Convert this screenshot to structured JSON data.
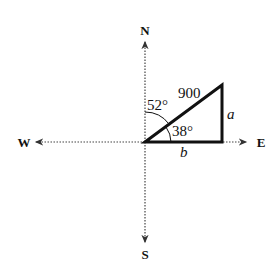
{
  "diagram": {
    "type": "vector-compass-triangle",
    "compass": {
      "north_label": "N",
      "south_label": "S",
      "east_label": "E",
      "west_label": "W"
    },
    "triangle": {
      "hypotenuse_label": "900",
      "vertical_side_label": "a",
      "horizontal_side_label": "b",
      "angle_from_north_label": "52°",
      "angle_from_east_label": "38°"
    },
    "colors": {
      "line": "#111111",
      "axis": "#444444",
      "background": "#ffffff"
    }
  }
}
